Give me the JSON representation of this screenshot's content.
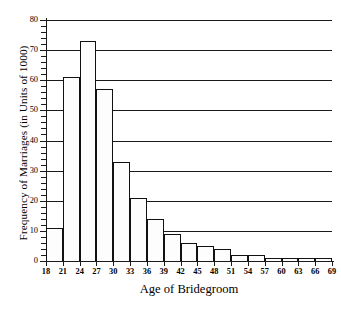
{
  "chart_data": {
    "type": "bar",
    "title": "",
    "xlabel": "Age of Bridegroom",
    "ylabel": "Frequency of Marriages (in Units of 1000)",
    "categories": [
      "18-21",
      "21-24",
      "24-27",
      "27-30",
      "30-33",
      "33-36",
      "36-39",
      "39-42",
      "42-45",
      "45-48",
      "48-51",
      "51-54",
      "54-57",
      "57-60",
      "60-63",
      "63-66",
      "66-69"
    ],
    "bin_edges": [
      18,
      21,
      24,
      27,
      30,
      33,
      36,
      39,
      42,
      45,
      48,
      51,
      54,
      57,
      60,
      63,
      66,
      69
    ],
    "values": [
      11,
      61,
      73,
      57,
      33,
      21,
      14,
      9,
      6,
      5,
      4,
      2,
      2,
      1,
      1,
      1,
      1
    ],
    "xlim": [
      18,
      69
    ],
    "ylim": [
      0,
      80
    ],
    "xtick_labels": [
      "18",
      "21",
      "24",
      "27",
      "30",
      "33",
      "36",
      "39",
      "42",
      "45",
      "48",
      "51",
      "54",
      "57",
      "60",
      "63",
      "66",
      "69"
    ],
    "ytick_labels": [
      "0",
      "10",
      "20",
      "30",
      "40",
      "50",
      "60",
      "70",
      "80"
    ],
    "ytick_values": [
      0,
      10,
      20,
      30,
      40,
      50,
      60,
      70,
      80
    ],
    "y_minor_tick_step": 2,
    "grid": "horizontal",
    "legend": "none",
    "bar_fill_color": "#fdfdfd",
    "bar_edge_color": "#111111",
    "axis_color": "#1a1a1a"
  }
}
